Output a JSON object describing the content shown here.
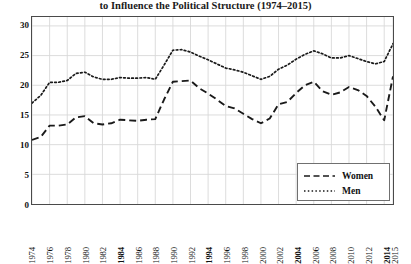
{
  "title": {
    "line1": "Percentage of Citizens Who Took Action",
    "line2": "to Influence the Political Structure (1974–2015)"
  },
  "legend": {
    "position": "bottom-right",
    "items": [
      {
        "label": "Women",
        "style": "dashed"
      },
      {
        "label": "Men",
        "style": "dotted"
      }
    ]
  },
  "axes": {
    "y": {
      "ticks": [
        "0",
        "5",
        "10",
        "15",
        "20",
        "25",
        "30"
      ],
      "min": 0,
      "max": 31.5,
      "label": ""
    },
    "x": {
      "label": "",
      "ticks": [
        {
          "label": "1974",
          "bold": false
        },
        {
          "label": "1976",
          "bold": false
        },
        {
          "label": "1978",
          "bold": false
        },
        {
          "label": "1980",
          "bold": false
        },
        {
          "label": "1982",
          "bold": false
        },
        {
          "label": "1984",
          "bold": true
        },
        {
          "label": "1986",
          "bold": false
        },
        {
          "label": "1988",
          "bold": false
        },
        {
          "label": "1990",
          "bold": false
        },
        {
          "label": "1992",
          "bold": false
        },
        {
          "label": "1994",
          "bold": true
        },
        {
          "label": "1996",
          "bold": false
        },
        {
          "label": "1998",
          "bold": false
        },
        {
          "label": "2000",
          "bold": false
        },
        {
          "label": "2002",
          "bold": false
        },
        {
          "label": "2004",
          "bold": true
        },
        {
          "label": "2006",
          "bold": false
        },
        {
          "label": "2008",
          "bold": false
        },
        {
          "label": "2010",
          "bold": false
        },
        {
          "label": "2012",
          "bold": false
        },
        {
          "label": "2014",
          "bold": true
        },
        {
          "label": "2015",
          "bold": false
        }
      ]
    }
  },
  "colors": {
    "line": "#1a1a1a",
    "grid": "#d8d8d8",
    "frame": "#4a4a4a",
    "background": "#ffffff"
  },
  "chart_data": {
    "type": "line",
    "title": "Percentage of Citizens Who Took Action to Influence the Political Structure (1974–2015)",
    "xlabel": "",
    "ylabel": "",
    "ylim": [
      0,
      31.5
    ],
    "grid": true,
    "legend_position": "bottom-right",
    "x": [
      1974,
      1975,
      1976,
      1977,
      1978,
      1979,
      1980,
      1981,
      1982,
      1983,
      1984,
      1985,
      1986,
      1987,
      1988,
      1989,
      1990,
      1991,
      1992,
      1993,
      1994,
      1995,
      1996,
      1997,
      1998,
      1999,
      2000,
      2001,
      2002,
      2003,
      2004,
      2005,
      2006,
      2007,
      2008,
      2009,
      2010,
      2011,
      2012,
      2013,
      2014,
      2015
    ],
    "series": [
      {
        "name": "Women",
        "style": "dashed",
        "values": [
          10.8,
          11.3,
          13.2,
          13.2,
          13.4,
          14.6,
          14.8,
          13.6,
          13.4,
          13.6,
          14.2,
          14.1,
          14.0,
          14.2,
          14.3,
          17.6,
          20.6,
          20.7,
          20.8,
          19.5,
          18.6,
          17.6,
          16.5,
          16.1,
          15.2,
          14.3,
          13.6,
          14.4,
          16.8,
          17.2,
          18.7,
          20.0,
          20.6,
          19.0,
          18.4,
          18.8,
          19.7,
          19.2,
          18.2,
          16.4,
          14.1,
          21.5
        ]
      },
      {
        "name": "Men",
        "style": "dotted",
        "values": [
          17.0,
          18.3,
          20.5,
          20.5,
          20.8,
          22.0,
          22.2,
          21.4,
          21.0,
          21.0,
          21.3,
          21.2,
          21.2,
          21.3,
          21.0,
          23.4,
          25.9,
          26.0,
          25.6,
          24.9,
          24.3,
          23.6,
          22.9,
          22.6,
          22.2,
          21.6,
          21.0,
          21.5,
          22.7,
          23.4,
          24.4,
          25.2,
          25.8,
          25.3,
          24.6,
          24.6,
          25.0,
          24.5,
          24.0,
          23.6,
          24.0,
          27.0
        ]
      }
    ]
  }
}
